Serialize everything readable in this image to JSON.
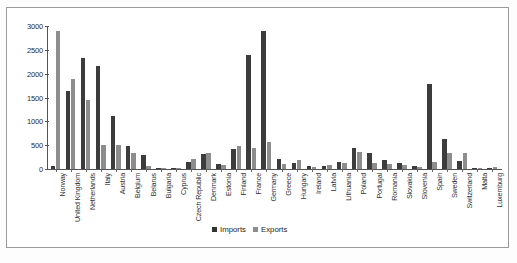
{
  "chart_data": {
    "type": "bar",
    "title": "",
    "xlabel": "",
    "ylabel": "",
    "ylim": [
      0,
      3000
    ],
    "yticks": [
      0,
      500,
      1000,
      1500,
      2000,
      2500,
      3000
    ],
    "grid": false,
    "legend_position": "bottom",
    "categories": [
      "Norway",
      "United Kingdom",
      "Netherlands",
      "Italy",
      "Austria",
      "Belgium",
      "Belarus",
      "Bulgaria",
      "Cyprus",
      "Czech Republic",
      "Denmark",
      "Estonia",
      "Finland",
      "France",
      "Germany",
      "Greece",
      "Hungary",
      "Ireland",
      "Latvia",
      "Lithuania",
      "Poland",
      "Portugal",
      "Romania",
      "Slovakia",
      "Slovenia",
      "Spain",
      "Sweden",
      "Switzerland",
      "Malta",
      "Luxemburg"
    ],
    "series": [
      {
        "name": "Imports",
        "color": "#3c3c3c",
        "values": [
          60,
          1640,
          2320,
          2170,
          1120,
          480,
          290,
          30,
          20,
          150,
          320,
          110,
          420,
          2400,
          2900,
          210,
          120,
          60,
          70,
          150,
          450,
          330,
          190,
          130,
          60,
          1780,
          620,
          160,
          10,
          15
        ]
      },
      {
        "name": "Exports",
        "color": "#8d8d8d",
        "values": [
          2900,
          1880,
          1440,
          500,
          500,
          330,
          60,
          10,
          15,
          200,
          330,
          80,
          480,
          440,
          560,
          110,
          190,
          40,
          90,
          120,
          350,
          120,
          110,
          80,
          40,
          150,
          330,
          330,
          10,
          40
        ]
      }
    ]
  },
  "legend": {
    "imports_label": "Imports",
    "exports_label": "Exports"
  },
  "caption": ""
}
